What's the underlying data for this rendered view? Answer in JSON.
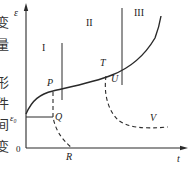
{
  "diagram": {
    "axes": {
      "y_label": "ε",
      "x_label": "t",
      "origin_label": "0",
      "y_initial_label": "ε₀"
    },
    "regions": [
      {
        "label": "I"
      },
      {
        "label": "II"
      },
      {
        "label": "III"
      }
    ],
    "points": {
      "P": "P",
      "Q": "Q",
      "T": "T",
      "U": "U",
      "V": "V",
      "R": "R"
    },
    "side_text_left": [
      "变",
      "量",
      "形",
      "件",
      "间",
      "变"
    ],
    "colors": {
      "line": "#2a2a2a",
      "text": "#222222",
      "background": "#ffffff"
    }
  }
}
